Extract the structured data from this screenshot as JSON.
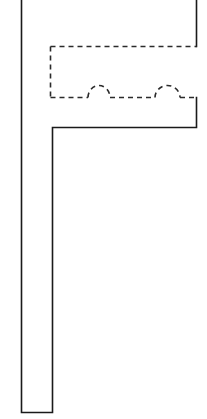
{
  "drawing": {
    "title": "Plan Detail",
    "canvas": {
      "width": 207,
      "height": 419,
      "background_color": "#ffffff"
    },
    "colors": {
      "solid_line": "#1a1a1a",
      "dashed_line": "#2b2b2b",
      "fill": "none"
    },
    "line_weights": {
      "solid_px": 1.6,
      "dashed_px": 1.6,
      "dash_pattern": "5 4"
    },
    "elements": {
      "wall_outline": {
        "name": "wall-outline",
        "style": "solid",
        "description": "L-shaped wall polyline forming an F-like plan profile",
        "path": "M 21.5 0 L 21.5 412.5 L 52.5 412.5 L 52.5 127.5 L 196.5 127.5 L 196.5 97.5 M 196.5 46.5 L 196.5 0"
      },
      "fixture_outline": {
        "name": "fixture-outline",
        "style": "dashed",
        "description": "Hidden-line rectangle of fixture with two arc bumps along its lower edge",
        "left_edge": "M 50.5 46.5 L 50.5 97.5",
        "top_edge": "M 50.5 46.5 L 196.5 46.5",
        "bottom_edge_left_run": "M 50.5 97.5 L 88 97.5",
        "bottom_edge_mid_run": "M 110 97.5 L 155 97.5",
        "bottom_edge_right_run": "M 180 97.5 L 196.5 97.5"
      },
      "arc_one": {
        "name": "fixture-arc-one",
        "style": "dashed",
        "description": "Left semicircular bump on fixture lower edge",
        "path": "M 88 97.5 A 11 12 0 0 1 110 97.5",
        "center_x": 99,
        "radius_x": 11,
        "radius_y": 12
      },
      "arc_two": {
        "name": "fixture-arc-two",
        "style": "dashed",
        "description": "Right semicircular bump on fixture lower edge",
        "path": "M 155 97.5 A 12.5 12 0 0 1 180 97.5",
        "center_x": 167.5,
        "radius_x": 12.5,
        "radius_y": 12
      }
    },
    "geometry_notes": {
      "wall_left_x": 21.5,
      "wall_inner_x": 52.5,
      "wall_bottom_y": 412.5,
      "ledge_y": 127.5,
      "right_edge_x": 196.5,
      "fixture_top_y": 46.5,
      "fixture_bottom_y": 97.5,
      "fixture_left_x": 50.5
    }
  }
}
